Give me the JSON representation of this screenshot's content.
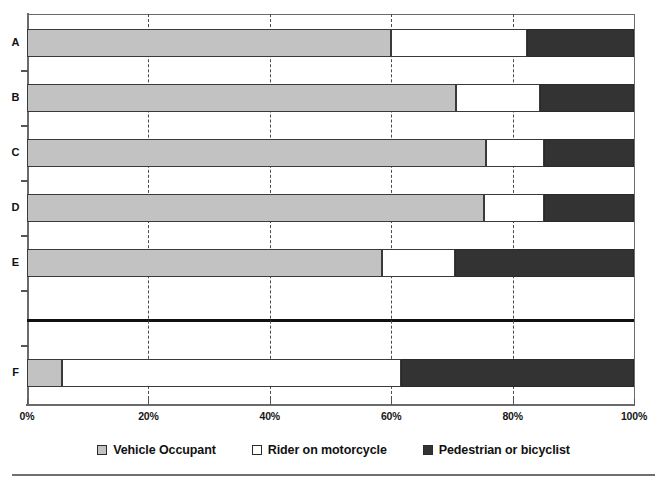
{
  "chart_data": {
    "type": "bar",
    "subtype": "stacked-horizontal-100-percent",
    "title": "",
    "subtitle": "",
    "xlabel": "",
    "ylabel": "",
    "categories": [
      "A",
      "B",
      "C",
      "D",
      "E",
      "F"
    ],
    "series": [
      {
        "name": "Vehicle Occupant",
        "color": "#c2c2c2",
        "values": [
          60.0,
          70.7,
          75.6,
          75.3,
          58.5,
          5.8
        ]
      },
      {
        "name": "Rider on motorcycle",
        "color": "#ffffff",
        "values": [
          22.4,
          13.8,
          9.6,
          9.9,
          12.0,
          55.8
        ]
      },
      {
        "name": "Pedestrian or bicyclist",
        "color": "#333333",
        "values": [
          17.6,
          15.5,
          14.8,
          14.8,
          29.5,
          38.4
        ]
      }
    ],
    "cumulative_boundaries": [
      [
        60.0,
        82.4
      ],
      [
        70.7,
        84.5
      ],
      [
        75.6,
        85.2
      ],
      [
        75.3,
        85.2
      ],
      [
        58.5,
        70.5
      ],
      [
        5.8,
        61.6
      ]
    ],
    "xlim": [
      0,
      100
    ],
    "xticks": [
      0,
      20,
      40,
      60,
      80,
      100
    ],
    "xtick_labels": [
      "0%",
      "20%",
      "40%",
      "60%",
      "80%",
      "100%"
    ],
    "grid": true,
    "grid_axis": "x",
    "grid_style": "dashed",
    "legend_position": "bottom",
    "annotations": [
      {
        "name": "group-separator",
        "between": [
          "E",
          "F"
        ],
        "style": "thick-black-horizontal-rule"
      }
    ]
  },
  "legend": {
    "items": [
      {
        "label": "Vehicle Occupant",
        "color": "#c2c2c2"
      },
      {
        "label": "Rider on motorcycle",
        "color": "#ffffff"
      },
      {
        "label": "Pedestrian or bicyclist",
        "color": "#333333"
      }
    ]
  },
  "axis": {
    "x_tick_labels": [
      "0%",
      "20%",
      "40%",
      "60%",
      "80%",
      "100%"
    ],
    "y_tick_labels": [
      "A",
      "B",
      "C",
      "D",
      "E",
      "F"
    ]
  },
  "colors": {
    "vehicle_occupant": "#c2c2c2",
    "rider_on_motorcycle": "#ffffff",
    "pedestrian_or_bicyclist": "#333333",
    "axis": "#6b6b6b",
    "gridline": "#4a4a4a",
    "separator": "#111111"
  }
}
